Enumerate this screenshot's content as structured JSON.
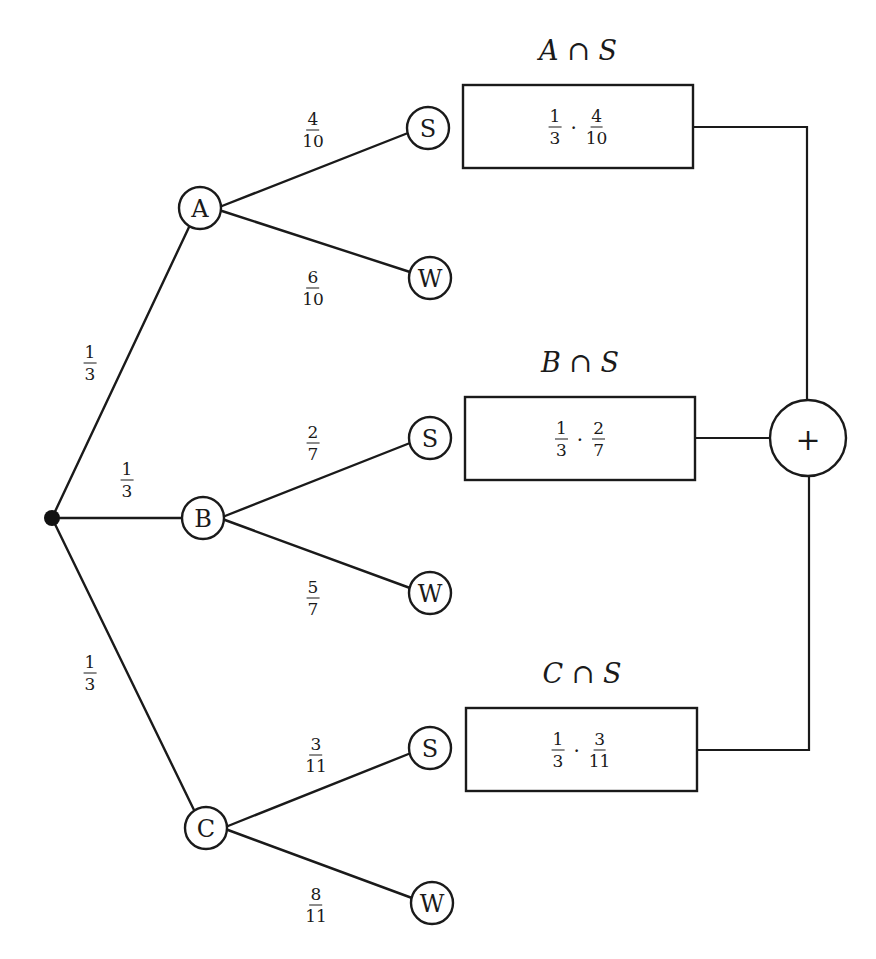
{
  "diagram": {
    "type": "probability-tree",
    "root": {
      "label": ""
    },
    "level1": [
      {
        "node": "A",
        "edge_prob": {
          "num": "1",
          "den": "3"
        }
      },
      {
        "node": "B",
        "edge_prob": {
          "num": "1",
          "den": "3"
        }
      },
      {
        "node": "C",
        "edge_prob": {
          "num": "1",
          "den": "3"
        }
      }
    ],
    "level2": {
      "A": [
        {
          "node": "S",
          "edge_prob": {
            "num": "4",
            "den": "10"
          }
        },
        {
          "node": "W",
          "edge_prob": {
            "num": "6",
            "den": "10"
          }
        }
      ],
      "B": [
        {
          "node": "S",
          "edge_prob": {
            "num": "2",
            "den": "7"
          }
        },
        {
          "node": "W",
          "edge_prob": {
            "num": "5",
            "den": "7"
          }
        }
      ],
      "C": [
        {
          "node": "S",
          "edge_prob": {
            "num": "3",
            "den": "11"
          }
        },
        {
          "node": "W",
          "edge_prob": {
            "num": "8",
            "den": "11"
          }
        }
      ]
    },
    "result_boxes": [
      {
        "title": "A ∩ S",
        "f1": {
          "num": "1",
          "den": "3"
        },
        "dot": "·",
        "f2": {
          "num": "4",
          "den": "10"
        }
      },
      {
        "title": "B ∩ S",
        "f1": {
          "num": "1",
          "den": "3"
        },
        "dot": "·",
        "f2": {
          "num": "2",
          "den": "7"
        }
      },
      {
        "title": "C ∩ S",
        "f1": {
          "num": "1",
          "den": "3"
        },
        "dot": "·",
        "f2": {
          "num": "3",
          "den": "11"
        }
      }
    ],
    "sum_node": {
      "symbol": "+"
    }
  }
}
